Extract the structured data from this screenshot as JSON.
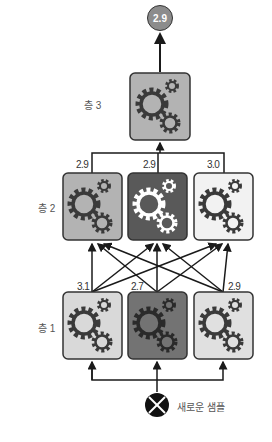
{
  "output": {
    "value": "2.9"
  },
  "layers": [
    {
      "label": "층 3",
      "nodes": [
        {
          "value": "",
          "fill": "#b3b3b3",
          "gear": "dark"
        }
      ]
    },
    {
      "label": "층 2",
      "nodes": [
        {
          "value": "2.9",
          "fill": "#b3b3b3",
          "gear": "dark"
        },
        {
          "value": "2.9",
          "fill": "#595959",
          "gear": "light"
        },
        {
          "value": "3.0",
          "fill": "#f2f2f2",
          "gear": "dark"
        }
      ]
    },
    {
      "label": "층 1",
      "nodes": [
        {
          "value": "3.1",
          "fill": "#d9d9d9",
          "gear": "dark"
        },
        {
          "value": "2.7",
          "fill": "#737373",
          "gear": "dark"
        },
        {
          "value": "2.9",
          "fill": "#e0e0e0",
          "gear": "dark"
        }
      ]
    }
  ],
  "input": {
    "label": "새로운 샘플",
    "icon": "x-circle-icon"
  },
  "colors": {
    "stroke": "#1a1a1a",
    "gear_dark": "#3a3a3a",
    "gear_light": "#ffffff"
  }
}
